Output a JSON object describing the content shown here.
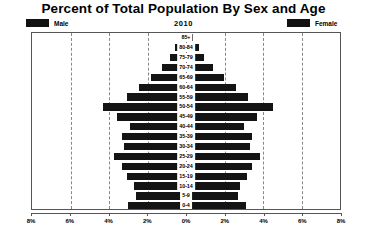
{
  "chart_data": {
    "type": "bar",
    "subtype": "population-pyramid",
    "title": "Percent of Total Population By Sex and Age",
    "year_label": "2010",
    "xlabel": "",
    "ylabel": "",
    "xlim": [
      -8,
      8
    ],
    "x_tick_labels": [
      "8%",
      "6%",
      "4%",
      "2%",
      "0%",
      "2%",
      "4%",
      "6%",
      "8%"
    ],
    "x_tick_values": [
      -8,
      -6,
      -4,
      -2,
      0,
      2,
      4,
      6,
      8
    ],
    "grid": true,
    "grid_style": "dashed-vertical",
    "legend_position": "top",
    "categories": [
      "85+",
      "80-84",
      "75-79",
      "70-74",
      "65-69",
      "60-64",
      "55-59",
      "50-54",
      "45-49",
      "40-44",
      "35-39",
      "30-34",
      "25-29",
      "20-24",
      "15-19",
      "10-14",
      "5-9",
      "0-4"
    ],
    "series": [
      {
        "name": "Male",
        "color": "#141414",
        "side": "left",
        "values": [
          0.3,
          0.55,
          0.85,
          1.25,
          1.8,
          2.45,
          3.05,
          4.3,
          3.6,
          2.9,
          3.35,
          3.2,
          3.75,
          3.35,
          3.05,
          2.7,
          2.6,
          3.0
        ]
      },
      {
        "name": "Female",
        "color": "#141414",
        "side": "right",
        "values": [
          0.35,
          0.65,
          0.95,
          1.4,
          1.95,
          2.6,
          3.2,
          4.5,
          3.7,
          3.0,
          3.45,
          3.3,
          3.85,
          3.45,
          3.15,
          2.8,
          2.7,
          3.1
        ]
      }
    ]
  },
  "legend": {
    "male_label": "Male",
    "female_label": "Female",
    "swatch_color": "#111111"
  },
  "colors": {
    "bar": "#141414",
    "frame": "#555555",
    "grid": "#888888",
    "background": "#ffffff"
  }
}
